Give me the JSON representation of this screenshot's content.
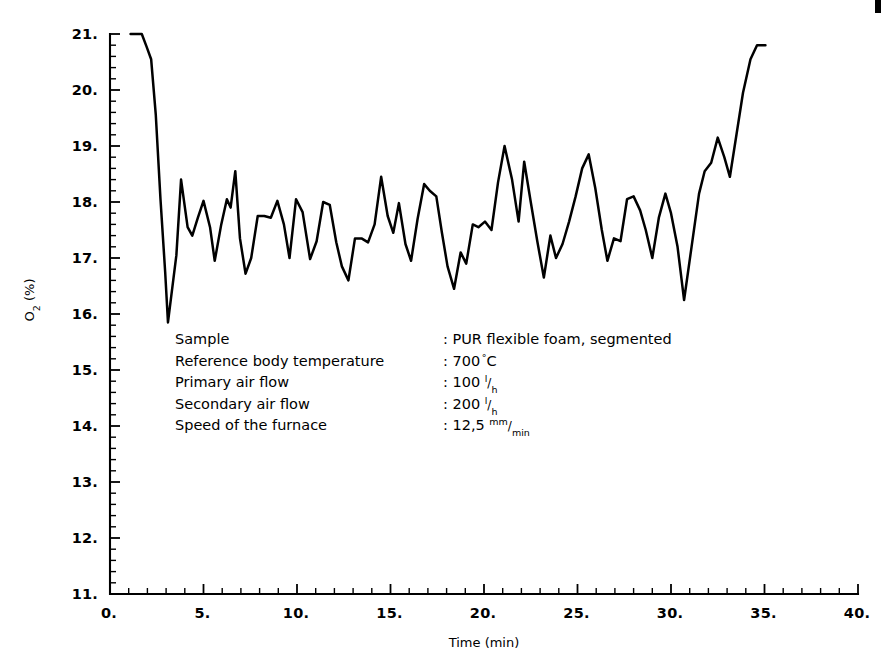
{
  "page": {
    "background_color": "#ffffff",
    "ink_color": "#000000",
    "width": 892,
    "height": 659
  },
  "edge_artifact": {
    "name": "page-edge-mark",
    "visible": true
  },
  "annotation": {
    "rows": [
      {
        "label": "Sample",
        "separator": ":",
        "value": "PUR flexible foam, segmented",
        "unit": "",
        "unit_sup": "",
        "unit_sub": ""
      },
      {
        "label": "Reference body temperature",
        "separator": ":",
        "value": "700",
        "unit": "C",
        "unit_sup": "°",
        "unit_sub": ""
      },
      {
        "label": "Primary air flow",
        "separator": ":",
        "value": "100",
        "unit": "",
        "unit_sup": "l",
        "unit_sub": "h"
      },
      {
        "label": "Secondary air flow",
        "separator": ":",
        "value": "200",
        "unit": "",
        "unit_sup": "l",
        "unit_sub": "h"
      },
      {
        "label": "Speed of the furnace",
        "separator": ":",
        "value": "12,5",
        "unit": "",
        "unit_sup": "mm",
        "unit_sub": "min"
      }
    ]
  },
  "chart_data": {
    "type": "line",
    "title": "",
    "subtitle": "",
    "xlabel": "Time (min)",
    "ylabel": "O₂ (%)",
    "ylabel_parts": {
      "base": "O",
      "sub": "2",
      "rest": " (%)"
    },
    "xlim": [
      0,
      40
    ],
    "ylim": [
      11,
      21
    ],
    "xticks": [
      0,
      5,
      10,
      15,
      20,
      25,
      30,
      35,
      40
    ],
    "xtick_labels": [
      "0.",
      "5.",
      "10.",
      "15.",
      "20.",
      "25.",
      "30.",
      "35.",
      "40."
    ],
    "yticks": [
      11,
      12,
      13,
      14,
      15,
      16,
      17,
      18,
      19,
      20,
      21
    ],
    "ytick_labels": [
      "11.",
      "12.",
      "13.",
      "14.",
      "15.",
      "16.",
      "17.",
      "18.",
      "19.",
      "20.",
      "21."
    ],
    "x_minor_interval": 1,
    "y_minor_interval": 0.2,
    "grid": false,
    "legend": null,
    "series": [
      {
        "name": "O2 concentration",
        "color": "#000000",
        "points": [
          [
            1.1,
            21.0
          ],
          [
            1.7,
            21.0
          ],
          [
            1.95,
            20.78
          ],
          [
            2.2,
            20.55
          ],
          [
            2.45,
            19.55
          ],
          [
            2.7,
            18.05
          ],
          [
            2.95,
            16.75
          ],
          [
            3.1,
            15.85
          ],
          [
            3.55,
            17.05
          ],
          [
            3.8,
            18.4
          ],
          [
            4.15,
            17.55
          ],
          [
            4.4,
            17.4
          ],
          [
            4.7,
            17.72
          ],
          [
            5.0,
            18.02
          ],
          [
            5.35,
            17.55
          ],
          [
            5.6,
            16.95
          ],
          [
            5.95,
            17.6
          ],
          [
            6.25,
            18.05
          ],
          [
            6.45,
            17.9
          ],
          [
            6.7,
            18.55
          ],
          [
            6.95,
            17.35
          ],
          [
            7.25,
            16.72
          ],
          [
            7.55,
            17.0
          ],
          [
            7.9,
            17.75
          ],
          [
            8.25,
            17.75
          ],
          [
            8.6,
            17.72
          ],
          [
            8.95,
            18.02
          ],
          [
            9.3,
            17.6
          ],
          [
            9.6,
            17.0
          ],
          [
            9.95,
            18.05
          ],
          [
            10.3,
            17.82
          ],
          [
            10.7,
            16.98
          ],
          [
            11.05,
            17.3
          ],
          [
            11.4,
            18.0
          ],
          [
            11.75,
            17.95
          ],
          [
            12.1,
            17.28
          ],
          [
            12.4,
            16.85
          ],
          [
            12.75,
            16.6
          ],
          [
            13.1,
            17.35
          ],
          [
            13.45,
            17.35
          ],
          [
            13.8,
            17.28
          ],
          [
            14.15,
            17.6
          ],
          [
            14.5,
            18.45
          ],
          [
            14.85,
            17.75
          ],
          [
            15.15,
            17.45
          ],
          [
            15.45,
            17.98
          ],
          [
            15.8,
            17.25
          ],
          [
            16.1,
            16.95
          ],
          [
            16.45,
            17.7
          ],
          [
            16.8,
            18.32
          ],
          [
            17.1,
            18.2
          ],
          [
            17.45,
            18.1
          ],
          [
            17.75,
            17.45
          ],
          [
            18.05,
            16.85
          ],
          [
            18.4,
            16.45
          ],
          [
            18.75,
            17.1
          ],
          [
            19.05,
            16.9
          ],
          [
            19.4,
            17.6
          ],
          [
            19.7,
            17.55
          ],
          [
            20.05,
            17.65
          ],
          [
            20.4,
            17.5
          ],
          [
            20.75,
            18.35
          ],
          [
            21.1,
            19.0
          ],
          [
            21.5,
            18.4
          ],
          [
            21.85,
            17.65
          ],
          [
            22.15,
            18.72
          ],
          [
            22.5,
            18.0
          ],
          [
            22.85,
            17.3
          ],
          [
            23.2,
            16.65
          ],
          [
            23.55,
            17.4
          ],
          [
            23.85,
            17.0
          ],
          [
            24.2,
            17.25
          ],
          [
            24.55,
            17.65
          ],
          [
            24.9,
            18.1
          ],
          [
            25.25,
            18.6
          ],
          [
            25.6,
            18.85
          ],
          [
            25.95,
            18.25
          ],
          [
            26.3,
            17.5
          ],
          [
            26.6,
            16.95
          ],
          [
            26.95,
            17.35
          ],
          [
            27.3,
            17.3
          ],
          [
            27.65,
            18.05
          ],
          [
            28.0,
            18.1
          ],
          [
            28.35,
            17.85
          ],
          [
            28.65,
            17.5
          ],
          [
            29.0,
            17.0
          ],
          [
            29.35,
            17.72
          ],
          [
            29.7,
            18.15
          ],
          [
            30.0,
            17.8
          ],
          [
            30.35,
            17.2
          ],
          [
            30.7,
            16.25
          ],
          [
            31.1,
            17.2
          ],
          [
            31.5,
            18.15
          ],
          [
            31.8,
            18.55
          ],
          [
            32.15,
            18.7
          ],
          [
            32.5,
            19.15
          ],
          [
            32.85,
            18.8
          ],
          [
            33.15,
            18.45
          ],
          [
            33.5,
            19.2
          ],
          [
            33.85,
            19.95
          ],
          [
            34.25,
            20.55
          ],
          [
            34.6,
            20.8
          ],
          [
            35.05,
            20.8
          ]
        ]
      }
    ]
  }
}
